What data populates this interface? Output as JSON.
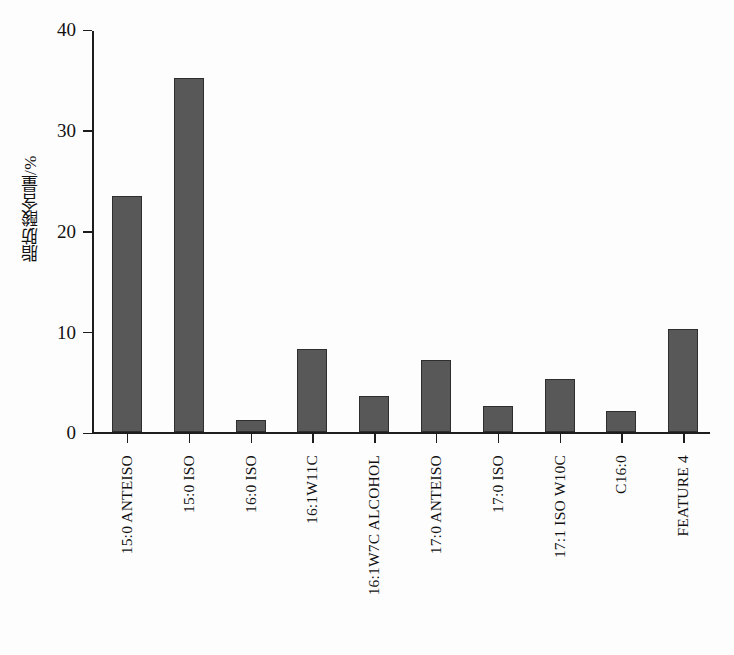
{
  "chart_data": {
    "type": "bar",
    "title": "",
    "subtitle": "",
    "xlabel": "",
    "ylabel": "脂肪酸含量/%",
    "ylim": [
      0,
      40
    ],
    "yticks": [
      0,
      10,
      20,
      30,
      40
    ],
    "ytick_labels": [
      "0",
      "10",
      "20",
      "30",
      "40"
    ],
    "grid": false,
    "legend": false,
    "bar_color": "#585858",
    "bar_edge_color": "#2e2e2e",
    "axis_color": "#1d1d1d",
    "background_color": "#fdfdfd",
    "categories": [
      "15:0 ANTEISO",
      "15:0 ISO",
      "16:0 ISO",
      "16:1W11C",
      "16:1W7C ALCOHOL",
      "17:0 ANTEISO",
      "17:0 ISO",
      "17:1 ISO W10C",
      "C16:0",
      "FEATURE 4"
    ],
    "values": [
      23.5,
      35.2,
      1.2,
      8.3,
      3.6,
      7.2,
      2.6,
      5.3,
      2.1,
      10.3
    ]
  }
}
